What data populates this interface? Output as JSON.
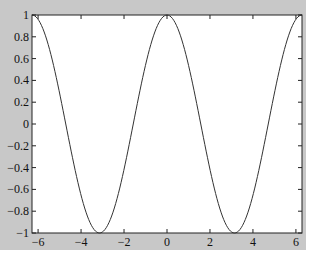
{
  "chart_data": {
    "type": "line",
    "title": "",
    "xlabel": "",
    "ylabel": "",
    "xlim": [
      -6.2832,
      6.2832
    ],
    "ylim": [
      -1,
      1
    ],
    "grid": false,
    "legend": null,
    "series": [
      {
        "name": "cos(x)",
        "function": "cos(x)",
        "color": "#333333",
        "x": [
          -6.2832,
          -5.4978,
          -4.7124,
          -3.927,
          -3.1416,
          -2.3562,
          -1.5708,
          -0.7854,
          0,
          0.7854,
          1.5708,
          2.3562,
          3.1416,
          3.927,
          4.7124,
          5.4978,
          6.2832
        ],
        "y": [
          1,
          0.7071,
          0,
          -0.7071,
          -1,
          -0.7071,
          0,
          0.7071,
          1,
          0.7071,
          0,
          -0.7071,
          -1,
          -0.7071,
          0,
          0.7071,
          1
        ]
      }
    ],
    "xticks": [
      -6,
      -4,
      -2,
      0,
      2,
      4,
      6
    ],
    "xtick_labels": [
      "−6",
      "−4",
      "−2",
      "0",
      "2",
      "4",
      "6"
    ],
    "yticks": [
      1,
      0.8,
      0.6,
      0.4,
      0.2,
      0,
      -0.2,
      -0.4,
      -0.6,
      -0.8,
      -1
    ],
    "ytick_labels": [
      "1",
      "0.8",
      "0.6",
      "0.4",
      "0.2",
      "0",
      "−0.2",
      "−0.4",
      "−0.6",
      "−0.8",
      "−1"
    ]
  },
  "colors": {
    "figure_bg": "#c8c8c8",
    "axes_bg": "#ffffff",
    "line": "#333333"
  }
}
